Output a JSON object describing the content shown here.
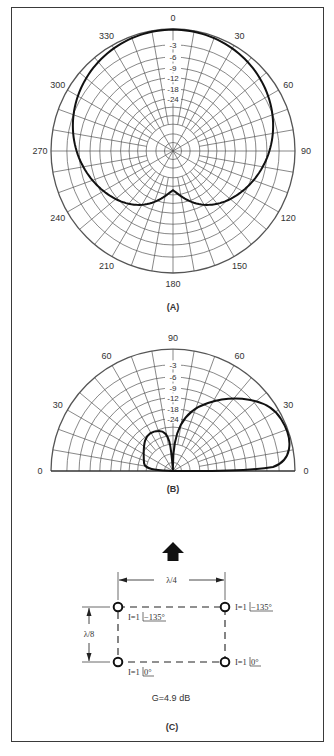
{
  "figure": {
    "border_color": "#3a3a3a",
    "grid_color": "#555555",
    "pattern_color": "#111111"
  },
  "plot_a": {
    "caption": "(A)",
    "type": "azimuth-polar",
    "center": [
      173,
      151
    ],
    "radius": 122,
    "angle_labels": [
      "0",
      "30",
      "60",
      "90",
      "120",
      "150",
      "180",
      "210",
      "240",
      "270",
      "300",
      "330"
    ],
    "db_labels": [
      "-3",
      "-6",
      "-9",
      "-12",
      "-18",
      "-24"
    ],
    "pattern_description": "Cardioid-like pattern, maximum toward 0 deg, shallow notch toward 180 deg"
  },
  "plot_b": {
    "caption": "(B)",
    "type": "elevation-polar",
    "center": [
      173,
      471
    ],
    "radius": 122,
    "angle_labels_left": [
      "0",
      "30",
      "60"
    ],
    "angle_labels_top": "90",
    "angle_labels_right": [
      "60",
      "30",
      "0"
    ],
    "db_labels": [
      "-3",
      "-6",
      "-9",
      "-12",
      "-18",
      "-24"
    ],
    "pattern_description": "Main lobe at low elevation (~25 deg) toward right, small minor lobe toward left"
  },
  "plot_c": {
    "caption": "(C)",
    "spacing_horizontal": "λ/4",
    "spacing_vertical": "λ/8",
    "elements": [
      {
        "position": "top-left",
        "label_prefix": "I=1",
        "phase": "−135°"
      },
      {
        "position": "top-right",
        "label_prefix": "I=1",
        "phase": "−135°"
      },
      {
        "position": "bottom-left",
        "label_prefix": "I=1",
        "phase": "0°"
      },
      {
        "position": "bottom-right",
        "label_prefix": "I=1",
        "phase": "0°"
      }
    ],
    "gain": "G=4.9 dB",
    "direction_arrow": "up-arrow"
  }
}
